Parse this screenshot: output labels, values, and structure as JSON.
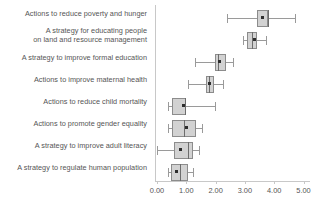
{
  "chart_data": {
    "type": "box",
    "title": "",
    "xlabel": "",
    "ylabel": "",
    "xlim": [
      0.0,
      5.0
    ],
    "grid": false,
    "legend": false,
    "orientation": "horizontal",
    "xticks": [
      "0.00",
      "1.00",
      "2.00",
      "3.00",
      "4.00",
      "5.00"
    ],
    "xtick_values": [
      0.0,
      1.0,
      2.0,
      3.0,
      4.0,
      5.0
    ],
    "categories": [
      "Actions to reduce poverty and hunger",
      "A strategy for educating people\non land and resource management",
      "A strategy to improve formal education",
      "Actions to improve maternal health",
      "Actions to reduce child mortality",
      "Actions to promote gender equality",
      "A strategy to improve adult literacy",
      "A strategy to regulate human population"
    ],
    "boxes": [
      {
        "category": "Actions to reduce poverty and hunger",
        "whisker_low": 2.4,
        "q1": 3.4,
        "median": 3.78,
        "q3": 3.78,
        "whisker_high": 4.7,
        "mean": 3.6
      },
      {
        "category": "A strategy for educating people on land and resource management",
        "whisker_low": 2.95,
        "q1": 3.08,
        "median": 3.25,
        "q3": 3.42,
        "whisker_high": 3.72,
        "mean": 3.3
      },
      {
        "category": "A strategy to improve formal education",
        "whisker_low": 1.3,
        "q1": 1.98,
        "median": 2.08,
        "q3": 2.35,
        "whisker_high": 2.6,
        "mean": 2.1
      },
      {
        "category": "Actions to improve maternal health",
        "whisker_low": 1.05,
        "q1": 1.68,
        "median": 1.78,
        "q3": 1.95,
        "whisker_high": 2.25,
        "mean": 1.76
      },
      {
        "category": "Actions to reduce child mortality",
        "whisker_low": 0.38,
        "q1": 0.5,
        "median": 0.95,
        "q3": 0.98,
        "whisker_high": 1.98,
        "mean": 0.88
      },
      {
        "category": "Actions to promote gender equality",
        "whisker_low": 0.38,
        "q1": 0.5,
        "median": 0.92,
        "q3": 1.32,
        "whisker_high": 1.55,
        "mean": 1.0
      },
      {
        "category": "A strategy to improve adult literacy",
        "whisker_low": 0.0,
        "q1": 0.58,
        "median": 1.05,
        "q3": 1.22,
        "whisker_high": 1.42,
        "mean": 0.8
      },
      {
        "category": "A strategy to regulate human population",
        "whisker_low": 0.38,
        "q1": 0.48,
        "median": 0.8,
        "q3": 1.05,
        "whisker_high": 1.22,
        "mean": 0.65
      }
    ],
    "colors": {
      "box_fill": "#d2d2d2",
      "box_edge": "#8c8c8c",
      "median": "#6d6d6d",
      "whisker": "#9a9a9a",
      "mean_marker": "#2e2e2e",
      "axis": "#c8c8c8",
      "text": "#555555",
      "background": "#ffffff"
    }
  }
}
